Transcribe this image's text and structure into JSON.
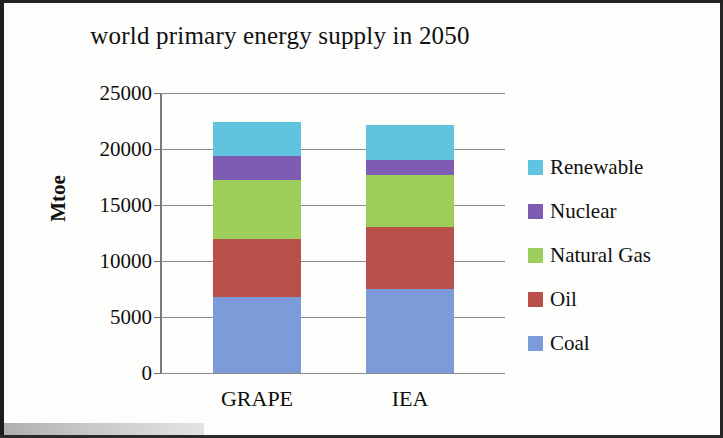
{
  "figure": {
    "title": "world primary energy supply in 2050",
    "x_axis_categories": [
      "GRAPE",
      "IEA"
    ],
    "y_axis_title": "Mtoe",
    "y_tick_labels": [
      "25000",
      "20000",
      "15000",
      "10000",
      "5000",
      "0"
    ]
  },
  "legend": {
    "items": [
      {
        "label": "Renewable",
        "color": "#60c3e0"
      },
      {
        "label": "Nuclear",
        "color": "#7f5cb4"
      },
      {
        "label": "Natural Gas",
        "color": "#9dcd5a"
      },
      {
        "label": "Oil",
        "color": "#b9504a"
      },
      {
        "label": "Coal",
        "color": "#7d9bd8"
      }
    ]
  },
  "chart_data": {
    "type": "bar",
    "stacked": true,
    "title": "world primary energy supply in 2050",
    "xlabel": "",
    "ylabel": "Mtoe",
    "ylim": [
      0,
      25000
    ],
    "yticks": [
      0,
      5000,
      10000,
      15000,
      20000,
      25000
    ],
    "grid": true,
    "legend_position": "right",
    "categories": [
      "GRAPE",
      "IEA"
    ],
    "series": [
      {
        "name": "Coal",
        "color": "#7d9bd8",
        "values": [
          6800,
          7500
        ]
      },
      {
        "name": "Oil",
        "color": "#b9504a",
        "values": [
          5200,
          5500
        ]
      },
      {
        "name": "Natural Gas",
        "color": "#9dcd5a",
        "values": [
          5200,
          4700
        ]
      },
      {
        "name": "Nuclear",
        "color": "#7f5cb4",
        "values": [
          2200,
          1300
        ]
      },
      {
        "name": "Renewable",
        "color": "#60c3e0",
        "values": [
          3000,
          3100
        ]
      }
    ],
    "totals": [
      22400,
      22100
    ]
  }
}
